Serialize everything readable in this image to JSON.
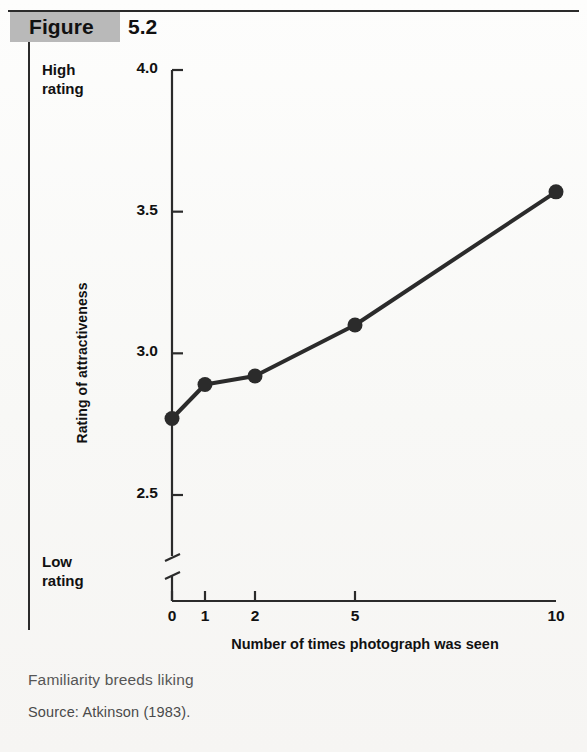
{
  "figure": {
    "label": "Figure",
    "number": "5.2"
  },
  "axes": {
    "high_rating_label": "High\nrating",
    "low_rating_label": "Low\nrating",
    "y_axis_title": "Rating of attractiveness",
    "x_axis_title": "Number of times photograph was seen"
  },
  "captions": {
    "title": "Familiarity breeds liking",
    "source": "Source: Atkinson (1983)."
  },
  "colors": {
    "line": "#2b2b2b",
    "marker": "#2b2b2b",
    "axis": "#2b2b2b",
    "band": "#b9b9b9",
    "paper": "#fbfbfa",
    "caption_text": "#565656"
  },
  "chart_data": {
    "type": "line",
    "title": "Familiarity breeds liking",
    "xlabel": "Number of times photograph was seen",
    "ylabel": "Rating of attractiveness",
    "x": [
      0,
      1,
      2,
      5,
      10
    ],
    "x_tick_labels": [
      "0",
      "1",
      "2",
      "5",
      "10"
    ],
    "values": [
      2.77,
      2.89,
      2.92,
      3.1,
      3.57
    ],
    "y_tick_labels": [
      "2.5",
      "3.0",
      "3.5",
      "4.0"
    ],
    "y_ticks": [
      2.5,
      3.0,
      3.5,
      4.0
    ],
    "ylim": [
      2.5,
      4.0
    ],
    "y_axis_broken": true,
    "x_scale": "ordinal-compressed",
    "grid": false,
    "legend": false,
    "markers": "filled-circle",
    "annotations": [
      "High rating",
      "Low rating"
    ]
  }
}
